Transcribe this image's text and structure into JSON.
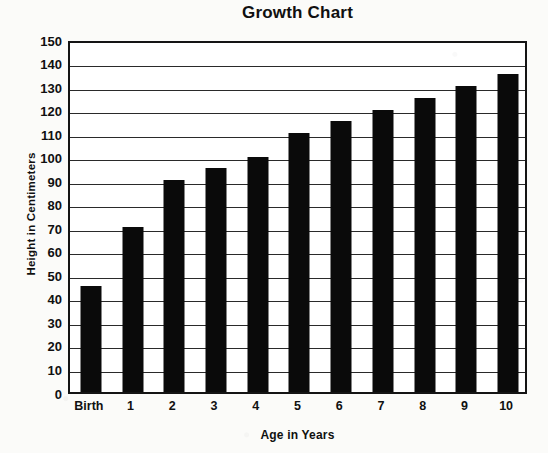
{
  "chart_data": {
    "type": "bar",
    "title": "Growth Chart",
    "xlabel": "Age in Years",
    "ylabel": "Height in Centimeters",
    "categories": [
      "Birth",
      "1",
      "2",
      "3",
      "4",
      "5",
      "6",
      "7",
      "8",
      "9",
      "10"
    ],
    "values": [
      45,
      70,
      90,
      95,
      100,
      110,
      115,
      120,
      125,
      130,
      135
    ],
    "ylim": [
      0,
      150
    ],
    "ytick_step": 10,
    "yticks": [
      150,
      140,
      130,
      120,
      110,
      100,
      90,
      80,
      70,
      60,
      50,
      40,
      30,
      20,
      10,
      0
    ],
    "ytick_labels": [
      "150",
      "140",
      "130",
      "120",
      "110",
      "100",
      "90",
      "80",
      "70",
      "60",
      "50",
      "40",
      "30",
      "20",
      "10",
      "0"
    ],
    "grid": true,
    "grid_axis": "y",
    "legend": null,
    "bar_color": "#0a0a0a",
    "frame_color": "#141414",
    "background_color": "#fbfbf9",
    "plot_background_color": "#ffffff"
  }
}
